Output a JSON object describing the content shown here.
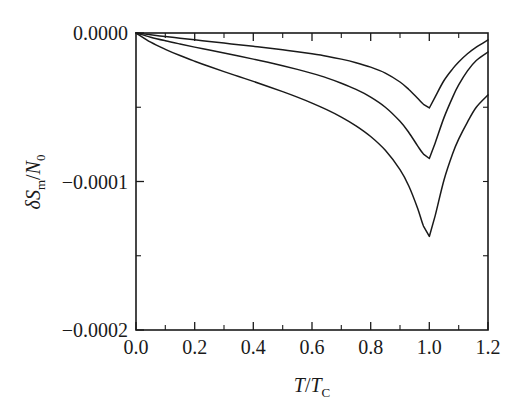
{
  "chart_data": {
    "type": "line",
    "title": "",
    "xlabel": "T/T_C",
    "ylabel": "δS_m/N_0",
    "xlim": [
      0.0,
      1.2
    ],
    "ylim": [
      -0.0002,
      0.0
    ],
    "grid": false,
    "legend": null,
    "xticks": [
      "0.0",
      "0.2",
      "0.4",
      "0.6",
      "0.8",
      "1.0",
      "1.2"
    ],
    "xtick_values": [
      0.0,
      0.2,
      0.4,
      0.6,
      0.8,
      1.0,
      1.2
    ],
    "yticks": [
      "0.0000",
      "−0.0001",
      "−0.0002"
    ],
    "ytick_values": [
      0.0,
      -0.0001,
      -0.0002
    ],
    "x": [
      0.0,
      0.05,
      0.1,
      0.15,
      0.2,
      0.25,
      0.3,
      0.35,
      0.4,
      0.45,
      0.5,
      0.55,
      0.6,
      0.65,
      0.7,
      0.75,
      0.8,
      0.85,
      0.9,
      0.93,
      0.96,
      0.98,
      1.0,
      1.02,
      1.05,
      1.08,
      1.1,
      1.13,
      1.16,
      1.2
    ],
    "series": [
      {
        "name": "curve-1-shallow",
        "minimum_x": 1.0,
        "minimum_y": -5.05e-05,
        "endpoint_y": -4.7e-06,
        "values": [
          0.0,
          -1.2e-06,
          -2.4e-06,
          -3.5e-06,
          -4.6e-06,
          -5.7e-06,
          -6.8e-06,
          -7.9e-06,
          -9e-06,
          -1.01e-05,
          -1.13e-05,
          -1.26e-05,
          -1.4e-05,
          -1.56e-05,
          -1.76e-05,
          -2e-05,
          -2.3e-05,
          -2.7e-05,
          -3.3e-05,
          -3.8e-05,
          -4.4e-05,
          -4.8e-05,
          -5.05e-05,
          -4.3e-05,
          -3.2e-05,
          -2.4e-05,
          -1.95e-05,
          -1.4e-05,
          -9.5e-06,
          -4.7e-06
        ]
      },
      {
        "name": "curve-2-middle",
        "minimum_x": 1.0,
        "minimum_y": -8.45e-05,
        "endpoint_y": -1.28e-05,
        "values": [
          0.0,
          -2.8e-06,
          -5.2e-06,
          -7.4e-06,
          -9.5e-06,
          -1.15e-05,
          -1.35e-05,
          -1.55e-05,
          -1.76e-05,
          -1.97e-05,
          -2.2e-05,
          -2.45e-05,
          -2.72e-05,
          -3.02e-05,
          -3.38e-05,
          -3.8e-05,
          -4.32e-05,
          -5e-05,
          -5.95e-05,
          -6.7e-05,
          -7.6e-05,
          -8.15e-05,
          -8.45e-05,
          -7.4e-05,
          -5.7e-05,
          -4.3e-05,
          -3.5e-05,
          -2.55e-05,
          -1.85e-05,
          -1.28e-05
        ]
      },
      {
        "name": "curve-3-deep",
        "minimum_x": 1.0,
        "minimum_y": -0.000137,
        "endpoint_y": -4.17e-05,
        "values": [
          0.0,
          -6.2e-06,
          -1.1e-05,
          -1.52e-05,
          -1.9e-05,
          -2.26e-05,
          -2.6e-05,
          -2.93e-05,
          -3.26e-05,
          -3.6e-05,
          -3.95e-05,
          -4.32e-05,
          -4.72e-05,
          -5.16e-05,
          -5.66e-05,
          -6.25e-05,
          -6.97e-05,
          -7.9e-05,
          -9.2e-05,
          -0.000103,
          -0.000118,
          -0.00013,
          -0.000137,
          -0.000123,
          -9.9e-05,
          -8.1e-05,
          -7.15e-05,
          -6e-05,
          -5e-05,
          -4.17e-05
        ]
      }
    ]
  },
  "axes": {
    "ylabel_delta": "δ",
    "ylabel_S": "S",
    "ylabel_S_sub": "m",
    "ylabel_slash": "/",
    "ylabel_N": "N",
    "ylabel_N_sub": "0",
    "xlabel_T": "T",
    "xlabel_slash": "/",
    "xlabel_Tc": "T",
    "xlabel_Tc_sub": "C"
  },
  "colors": {
    "background": "#ffffff",
    "axis": "#1a1a1a",
    "curve": "#1a1a1a",
    "text": "#1a1a1a"
  }
}
